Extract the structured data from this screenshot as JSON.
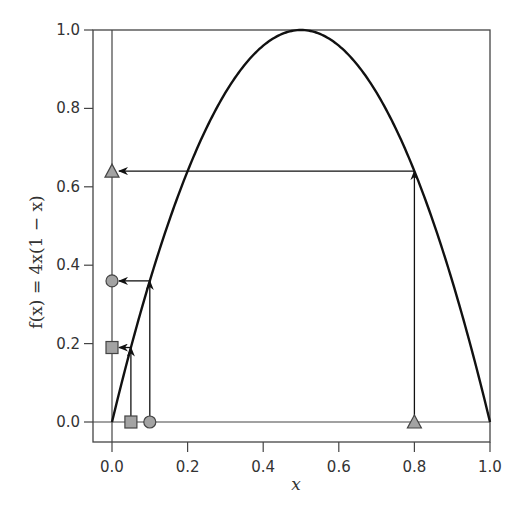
{
  "chart_data": {
    "type": "line",
    "title": "",
    "xlabel": "x",
    "ylabel": "f(x) = 4x(1 − x)",
    "xlim": [
      0.0,
      1.0
    ],
    "ylim": [
      0.0,
      1.0
    ],
    "grid": false,
    "legend": null,
    "x_ticks": [
      "0.0",
      "0.2",
      "0.4",
      "0.6",
      "0.8",
      "1.0"
    ],
    "y_ticks": [
      "0.0",
      "0.2",
      "0.4",
      "0.6",
      "0.8",
      "1.0"
    ],
    "series": [
      {
        "name": "f(x) = 4x(1 − x)",
        "function": "4*x*(1-x)",
        "color": "#111111",
        "x": [
          0.0,
          0.1,
          0.2,
          0.3,
          0.4,
          0.5,
          0.6,
          0.7,
          0.8,
          0.9,
          1.0
        ],
        "y": [
          0.0,
          0.36,
          0.64,
          0.84,
          0.96,
          1.0,
          0.96,
          0.84,
          0.64,
          0.36,
          0.0
        ]
      }
    ],
    "mappings": [
      {
        "marker": "square",
        "x": 0.05,
        "fx": 0.19
      },
      {
        "marker": "circle",
        "x": 0.1,
        "fx": 0.36
      },
      {
        "marker": "triangle",
        "x": 0.8,
        "fx": 0.64
      }
    ],
    "marker_fill": "#a3a3a3",
    "marker_stroke": "#444444"
  },
  "labels": {
    "xlabel": "x",
    "ylabel": "f(x) = 4x(1 − x)"
  }
}
